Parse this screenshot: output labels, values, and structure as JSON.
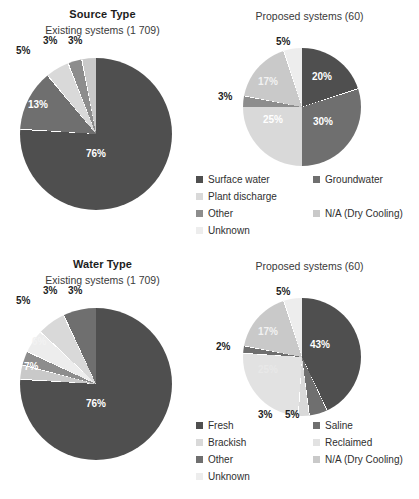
{
  "palette": {
    "dark": "#4f4f4f",
    "mid_dark": "#6f6f6f",
    "light": "#d9d9d9",
    "mid": "#8d8d8d",
    "lighter": "#c9c9c9",
    "very_light": "#ededed",
    "pale": "#e2e2e2",
    "background": "#ffffff",
    "text": "#2b2b2b"
  },
  "chart_data": [
    {
      "type": "pie",
      "title": "Source Type",
      "subtitle": "Existing systems (1 709)",
      "position": "top-left",
      "categories": [
        "Surface water",
        "Groundwater",
        "Plant discharge",
        "Other",
        "Unknown"
      ],
      "values": [
        76,
        13,
        5,
        3,
        3
      ],
      "labels": [
        "76%",
        "13%",
        "5%",
        "3%",
        "3%"
      ],
      "colors": [
        "#4f4f4f",
        "#6f6f6f",
        "#d9d9d9",
        "#8d8d8d",
        "#c9c9c9"
      ]
    },
    {
      "type": "pie",
      "title": "Proposed systems (60)",
      "subtitle": "",
      "position": "top-right",
      "categories": [
        "Surface water",
        "Groundwater",
        "Plant discharge",
        "Other",
        "N/A (Dry Cooling)",
        "Unknown"
      ],
      "values": [
        20,
        30,
        25,
        3,
        17,
        5
      ],
      "labels": [
        "20%",
        "30%",
        "25%",
        "3%",
        "17%",
        "5%"
      ],
      "colors": [
        "#4f4f4f",
        "#6f6f6f",
        "#d9d9d9",
        "#8d8d8d",
        "#c9c9c9",
        "#ededed"
      ]
    },
    {
      "type": "pie",
      "title": "Water Type",
      "subtitle": "Existing systems (1 709)",
      "position": "bottom-left",
      "categories": [
        "Fresh",
        "Saline",
        "Brackish",
        "Reclaimed",
        "Other",
        "Unknown"
      ],
      "values": [
        76,
        3,
        3,
        5,
        6,
        7
      ],
      "labels": [
        "76%",
        "3%",
        "3%",
        "5%",
        "6%",
        "7%"
      ],
      "colors": [
        "#4f4f4f",
        "#c9c9c9",
        "#8d8d8d",
        "#ededed",
        "#d9d9d9",
        "#6f6f6f"
      ]
    },
    {
      "type": "pie",
      "title": "Proposed systems (60)",
      "subtitle": "",
      "position": "bottom-right",
      "categories": [
        "Fresh",
        "Saline",
        "Brackish",
        "Reclaimed",
        "Other",
        "N/A (Dry Cooling)",
        "Unknown"
      ],
      "values": [
        43,
        5,
        3,
        25,
        2,
        17,
        5
      ],
      "labels": [
        "43%",
        "5%",
        "3%",
        "25%",
        "2%",
        "17%",
        "5%"
      ],
      "colors": [
        "#4f4f4f",
        "#6f6f6f",
        "#d9d9d9",
        "#e2e2e2",
        "#6f6f6f",
        "#c9c9c9",
        "#ededed"
      ]
    }
  ],
  "source_type": {
    "title": "Source Type",
    "subtitle_left": "Existing systems (1 709)",
    "subtitle_right": "Proposed systems (60)",
    "left_labels": {
      "l0": "76%",
      "l1": "13%",
      "l2": "5%",
      "l3": "3%",
      "l4": "3%"
    },
    "right_labels": {
      "r0": "20%",
      "r1": "30%",
      "r2": "25%",
      "r3": "3%",
      "r4": "17%",
      "r5": "5%"
    },
    "legend": [
      {
        "label": "Surface water",
        "color": "#4f4f4f"
      },
      {
        "label": "Groundwater",
        "color": "#6f6f6f"
      },
      {
        "label": "Plant discharge",
        "color": "#d9d9d9"
      },
      {
        "label": "Other",
        "color": "#8d8d8d"
      },
      {
        "label": "N/A (Dry Cooling)",
        "color": "#c9c9c9"
      },
      {
        "label": "Unknown",
        "color": "#ededed"
      }
    ]
  },
  "water_type": {
    "title": "Water Type",
    "subtitle_left": "Existing systems (1 709)",
    "subtitle_right": "Proposed systems (60)",
    "left_labels": {
      "l0": "76%",
      "l1": "7%",
      "l2": "6%",
      "l3": "5%",
      "l4": "3%",
      "l5": "3%"
    },
    "right_labels": {
      "r0": "43%",
      "r1": "5%",
      "r2": "3%",
      "r3": "25%",
      "r4": "2%",
      "r5": "17%",
      "r6": "5%"
    },
    "legend": [
      {
        "label": "Fresh",
        "color": "#4f4f4f"
      },
      {
        "label": "Saline",
        "color": "#6f6f6f"
      },
      {
        "label": "Brackish",
        "color": "#d9d9d9"
      },
      {
        "label": "Reclaimed",
        "color": "#e2e2e2"
      },
      {
        "label": "Other",
        "color": "#6f6f6f"
      },
      {
        "label": "N/A (Dry Cooling)",
        "color": "#c9c9c9"
      },
      {
        "label": "Unknown",
        "color": "#ededed"
      }
    ]
  }
}
